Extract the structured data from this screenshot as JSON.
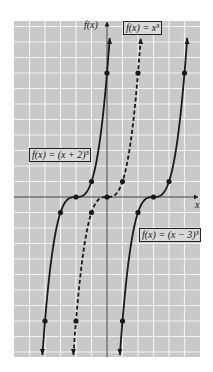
{
  "chart_data": {
    "type": "line",
    "title": "",
    "xlabel": "x",
    "ylabel": "f(x)",
    "xlim": [
      -6,
      6
    ],
    "ylim": [
      -10.3,
      11.3
    ],
    "grid": true,
    "grid_step": 1,
    "legend_position": "inline-boxes",
    "series": [
      {
        "name": "f(x) = (x + 2)^3",
        "label": "f(x) = (x + 2)³",
        "style": "solid",
        "formula_shift": -2,
        "points": [
          [
            -4,
            -8
          ],
          [
            -3,
            -1
          ],
          [
            -2,
            0
          ],
          [
            -1,
            1
          ],
          [
            0,
            8
          ]
        ]
      },
      {
        "name": "f(x) = x^3",
        "label": "f(x) = x³",
        "style": "dashed",
        "formula_shift": 0,
        "points": [
          [
            -2,
            -8
          ],
          [
            -1,
            -1
          ],
          [
            0,
            0
          ],
          [
            1,
            1
          ],
          [
            2,
            8
          ]
        ]
      },
      {
        "name": "f(x) = (x - 3)^3",
        "label": "f(x) = (x − 3)³",
        "style": "solid",
        "formula_shift": 3,
        "points": [
          [
            1,
            -8
          ],
          [
            2,
            -1
          ],
          [
            3,
            0
          ],
          [
            4,
            1
          ],
          [
            5,
            8
          ]
        ]
      }
    ]
  },
  "labels": {
    "y_axis": "f(x)",
    "x_axis": "x",
    "box_cubic": "f(x) = x³",
    "box_left": "f(x) = (x + 2)³",
    "box_right": "f(x) = (x − 3)³"
  },
  "colors": {
    "plot_bg": "#c9c9c9",
    "grid": "#f2f2f2",
    "curve": "#1a1a1a",
    "axis": "#333333"
  }
}
